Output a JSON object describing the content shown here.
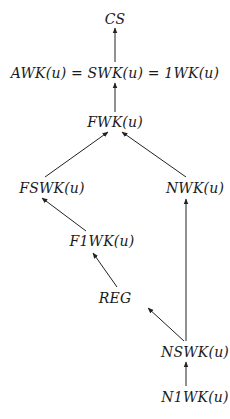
{
  "diagram": {
    "type": "hierarchy",
    "nodes": [
      {
        "id": "cs",
        "label": "CS",
        "x": 115,
        "y": 19
      },
      {
        "id": "awk",
        "label": "AWK(u) = SWK(u) = 1WK(u)",
        "x": 115,
        "y": 73
      },
      {
        "id": "fwk",
        "label": "FWK(u)",
        "x": 115,
        "y": 122
      },
      {
        "id": "fswk",
        "label": "FSWK(u)",
        "x": 52,
        "y": 188
      },
      {
        "id": "nwk",
        "label": "NWK(u)",
        "x": 195,
        "y": 188
      },
      {
        "id": "f1wk",
        "label": "F1WK(u)",
        "x": 102,
        "y": 241
      },
      {
        "id": "reg",
        "label": "REG",
        "x": 115,
        "y": 298
      },
      {
        "id": "nswk",
        "label": "NSWK(u)",
        "x": 195,
        "y": 352
      },
      {
        "id": "n1wk",
        "label": "N1WK(u)",
        "x": 195,
        "y": 397
      }
    ],
    "edges": [
      {
        "from": "awk",
        "to": "cs",
        "x1": 115,
        "y1": 62,
        "x2": 115,
        "y2": 28
      },
      {
        "from": "fwk",
        "to": "awk",
        "x1": 115,
        "y1": 112,
        "x2": 115,
        "y2": 83
      },
      {
        "from": "fswk",
        "to": "fwk",
        "x1": 45,
        "y1": 177,
        "x2": 108,
        "y2": 132
      },
      {
        "from": "nwk",
        "to": "fwk",
        "x1": 186,
        "y1": 177,
        "x2": 122,
        "y2": 132
      },
      {
        "from": "f1wk",
        "to": "fswk",
        "x1": 86,
        "y1": 231,
        "x2": 42,
        "y2": 198
      },
      {
        "from": "reg",
        "to": "f1wk",
        "x1": 117,
        "y1": 287,
        "x2": 93,
        "y2": 253
      },
      {
        "from": "nswk",
        "to": "reg",
        "x1": 184,
        "y1": 341,
        "x2": 148,
        "y2": 308
      },
      {
        "from": "nswk",
        "to": "nwk",
        "x1": 186,
        "y1": 341,
        "x2": 186,
        "y2": 199
      },
      {
        "from": "n1wk",
        "to": "nswk",
        "x1": 186,
        "y1": 386,
        "x2": 186,
        "y2": 362
      }
    ]
  }
}
